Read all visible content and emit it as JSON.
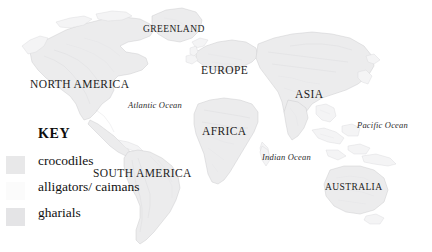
{
  "map": {
    "title": "World distribution of crocodilians",
    "background_color": "#ffffff",
    "land_color": "#ececed",
    "land_outline_color": "#c9c9cc",
    "labels": {
      "continents": [
        {
          "name": "GREENLAND",
          "text": "GREENLAND",
          "x": 143,
          "y": 24,
          "size": "small"
        },
        {
          "name": "NORTH AMERICA",
          "text": "NORTH AMERICA",
          "x": 30,
          "y": 78,
          "size": "normal"
        },
        {
          "name": "EUROPE",
          "text": "EUROPE",
          "x": 201,
          "y": 64,
          "size": "normal"
        },
        {
          "name": "ASIA",
          "text": "ASIA",
          "x": 295,
          "y": 88,
          "size": "normal"
        },
        {
          "name": "AFRICA",
          "text": "AFRICA",
          "x": 202,
          "y": 125,
          "size": "normal"
        },
        {
          "name": "SOUTH AMERICA",
          "text": "SOUTH AMERICA",
          "x": 93,
          "y": 167,
          "size": "normal"
        },
        {
          "name": "AUSTRALIA",
          "text": "AUSTRALIA",
          "x": 325,
          "y": 182,
          "size": "small"
        }
      ],
      "oceans": [
        {
          "name": "Atlantic Ocean",
          "text": "Atlantic Ocean",
          "x": 128,
          "y": 100
        },
        {
          "name": "Indian Ocean",
          "text": "Indian Ocean",
          "x": 262,
          "y": 152
        },
        {
          "name": "Pacific Ocean",
          "text": "Pacific Ocean",
          "x": 357,
          "y": 120
        }
      ]
    }
  },
  "legend": {
    "title": "KEY",
    "items": [
      {
        "label": "crocodiles",
        "color": "#e8e8e9",
        "swatch_name": "crocodiles-swatch"
      },
      {
        "label": "alligators/ caimans",
        "color": "#fbfbfb",
        "swatch_name": "alligators-caimans-swatch"
      },
      {
        "label": "gharials",
        "color": "#e4e4e6",
        "swatch_name": "gharials-swatch"
      }
    ]
  }
}
